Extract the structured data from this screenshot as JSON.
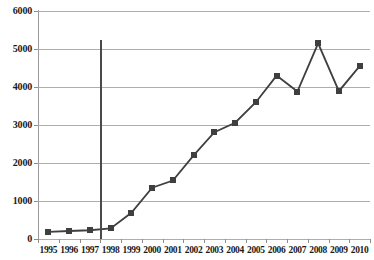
{
  "chart_data": {
    "type": "line",
    "title": "",
    "xlabel": "",
    "ylabel": "",
    "categories": [
      "1995",
      "1996",
      "1997",
      "1998",
      "1999",
      "2000",
      "2001",
      "2002",
      "2003",
      "2004",
      "2005",
      "2006",
      "2007",
      "2008",
      "2009",
      "2010"
    ],
    "values": [
      190,
      210,
      230,
      280,
      690,
      1350,
      1540,
      2200,
      2810,
      3060,
      3600,
      4300,
      3880,
      5150,
      3890,
      4550
    ],
    "series": [
      {
        "name": "series-1",
        "values": [
          190,
          210,
          230,
          280,
          690,
          1350,
          1540,
          2200,
          2810,
          3060,
          3600,
          4300,
          3880,
          5150,
          3890,
          4550
        ]
      }
    ],
    "ylim": [
      0,
      6000
    ],
    "yticks": [
      0,
      1000,
      2000,
      3000,
      4000,
      5000,
      6000
    ],
    "ytick_labels": [
      "0",
      "1000",
      "2000",
      "3000",
      "4000",
      "5000",
      "6000"
    ],
    "grid": true,
    "legend": false,
    "legend_position": "none",
    "annotations": [
      {
        "type": "vertical-reference-line",
        "between": [
          "1997",
          "1998"
        ],
        "value_top": 5250,
        "value_bottom": 0,
        "label": ""
      }
    ],
    "marker": "square",
    "colors": {
      "line": "#3f3f3f",
      "marker": "#3f3f3f",
      "grid": "#aeaeae",
      "axis": "#9a9a9a",
      "reference_line": "#4a4a4a",
      "background": "#ffffff",
      "text": "#1a1a1a"
    }
  }
}
